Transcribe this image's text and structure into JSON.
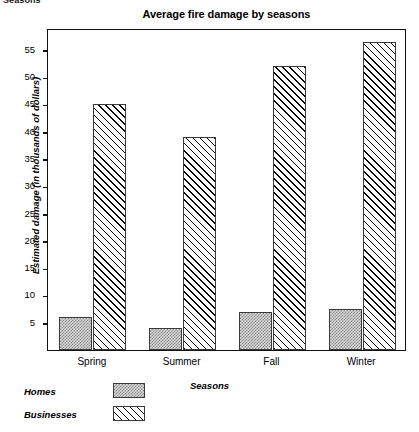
{
  "clipped_header": "Seasons",
  "chart_data": {
    "type": "bar",
    "title": "Average fire damage by seasons",
    "xlabel": "Seasons",
    "ylabel": "Estimated damage (in thousands of dollars)",
    "categories": [
      "Spring",
      "Summer",
      "Fall",
      "Winter"
    ],
    "series": [
      {
        "name": "Homes",
        "values": [
          6,
          4,
          7,
          7.5
        ],
        "pattern": "dotted-grey"
      },
      {
        "name": "Businesses",
        "values": [
          45,
          39,
          52,
          56.5
        ],
        "pattern": "diagonal-hatch"
      }
    ],
    "ylim": [
      0,
      59
    ],
    "yticks": [
      5,
      10,
      15,
      20,
      25,
      30,
      35,
      40,
      45,
      50,
      55
    ],
    "ytick_labels": [
      "5",
      "10",
      "15",
      "20",
      "25",
      "30",
      "35",
      "40",
      "45",
      "50",
      "55"
    ],
    "grid": false,
    "legend_position": "below-left",
    "legend_entries": [
      "Homes",
      "Businesses"
    ]
  }
}
